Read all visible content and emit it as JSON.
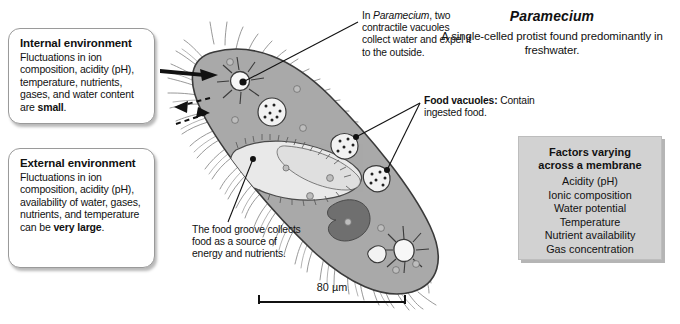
{
  "figure": {
    "title": "Paramecium",
    "subtitle": "A single-celled protist found predominantly in freshwater.",
    "organism_italic": true
  },
  "internal_box": {
    "heading": "Internal environment",
    "body_pre": "Fluctuations in ion composition, acidity (pH), temperature, nutrients, gases, and water content are ",
    "body_emphasis": "small",
    "body_post": "."
  },
  "external_box": {
    "heading": "External environment",
    "body_pre": "Fluctuations in ion composition, acidity (pH), availability of water, gases, nutrients, and temperature can be ",
    "body_emphasis": "very large",
    "body_post": "."
  },
  "captions": {
    "contractile_vacuole_pre": "In ",
    "contractile_vacuole_italic": "Paramecium",
    "contractile_vacuole_post": ", two contractile vacuoles collect water and expel it to the outside.",
    "food_vacuole_label": "Food vacuoles:",
    "food_vacuole_text": " Contain ingested food.",
    "food_groove_text": "The food groove collects food as a source of energy and nutrients."
  },
  "factors_box": {
    "heading_line1": "Factors varying",
    "heading_line2": "across a membrane",
    "items": [
      "Acidity (pH)",
      "Ionic composition",
      "Water potential",
      "Temperature",
      "Nutrient availability",
      "Gas concentration"
    ]
  },
  "scale": {
    "label": "80 µm"
  },
  "colors": {
    "cytoplasm": "#a9a9a9",
    "oral_groove": "#e9e9e9",
    "macronucleus": "#6f6f6f",
    "vacuole_fill": "#f5f5f5",
    "outline": "#3a3a3a",
    "factors_box_bg": "#d2d2d2",
    "page_bg": "#ffffff"
  }
}
